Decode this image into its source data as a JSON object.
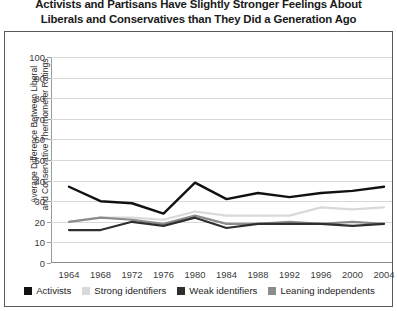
{
  "title": {
    "line1": "Activists and Partisans Have Slightly Stronger Feelings About",
    "line2": "Liberals and Conservatives than They Did a Generation Ago"
  },
  "axis_title": {
    "line1": "Average Difference Between Liberal",
    "line2": "and Conservative Thermometer Ratings"
  },
  "chart_data": {
    "type": "line",
    "title": "Activists and Partisans Have Slightly Stronger Feelings About Liberals and Conservatives than They Did a Generation Ago",
    "xlabel": "",
    "ylabel": "Average Difference Between Liberal and Conservative Thermometer Ratings",
    "x": [
      1964,
      1968,
      1972,
      1976,
      1980,
      1984,
      1988,
      1992,
      1996,
      2000,
      2004
    ],
    "xticklabels": [
      "1964",
      "1968",
      "1972",
      "1976",
      "1980",
      "1984",
      "1988",
      "1992",
      "1996",
      "2000",
      "2004"
    ],
    "yticklabels": [
      "0",
      "10",
      "20",
      "30",
      "40",
      "50",
      "60",
      "70",
      "80",
      "90",
      "100"
    ],
    "ylim": [
      0,
      100
    ],
    "ytick_step": 10,
    "grid": true,
    "legend_position": "bottom",
    "series": [
      {
        "name": "Activists",
        "color": "#111111",
        "values": [
          37,
          30,
          29,
          24,
          39,
          31,
          34,
          32,
          34,
          35,
          37
        ]
      },
      {
        "name": "Strong identifiers",
        "color": "#d9d9d9",
        "values": [
          20,
          22,
          22,
          21,
          25,
          23,
          23,
          23,
          27,
          26,
          27
        ]
      },
      {
        "name": "Weak identifiers",
        "color": "#2e2e2e",
        "values": [
          16,
          16,
          20,
          18,
          22,
          17,
          19,
          19,
          19,
          18,
          19
        ]
      },
      {
        "name": "Leaning independents",
        "color": "#8c8c8c",
        "values": [
          20,
          22,
          21,
          19,
          23,
          19,
          19,
          20,
          19,
          20,
          19
        ]
      }
    ]
  },
  "legend": [
    {
      "label": "Activists",
      "color": "#111111"
    },
    {
      "label": "Strong identifiers",
      "color": "#d9d9d9"
    },
    {
      "label": "Weak identifiers",
      "color": "#2e2e2e"
    },
    {
      "label": "Leaning independents",
      "color": "#8c8c8c"
    }
  ]
}
